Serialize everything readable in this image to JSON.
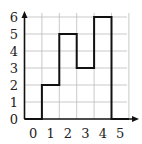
{
  "chart_data": {
    "type": "bar",
    "title": "",
    "xlabel": "",
    "ylabel": "",
    "categories": [
      "0",
      "1",
      "2",
      "3",
      "4",
      "5"
    ],
    "values": [
      0,
      2,
      5,
      3,
      6,
      0
    ],
    "x_tick_labels": [
      "0",
      "1",
      "2",
      "3",
      "4",
      "5"
    ],
    "y_tick_labels": [
      "0",
      "1",
      "2",
      "3",
      "4",
      "5",
      "6"
    ],
    "ylim": [
      0,
      6
    ],
    "grid": true,
    "legend": null,
    "style": "step-outline histogram"
  },
  "colors": {
    "axis": "#111111",
    "grid": "#bbbbbb",
    "outline": "#111111",
    "text": "#222222"
  }
}
